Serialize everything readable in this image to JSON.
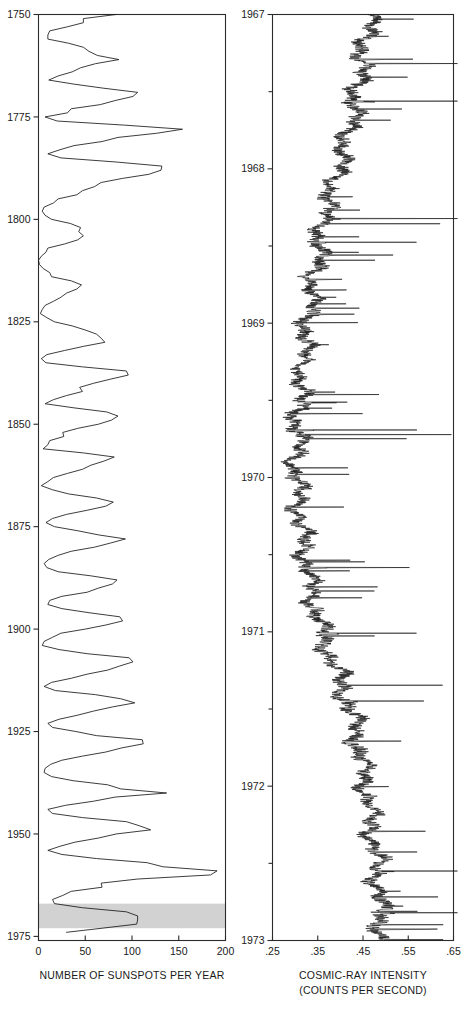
{
  "figure": {
    "background_color": "#ffffff",
    "line_color": "#1a1a1a",
    "shade_color": "#d2d2d2"
  },
  "chart_data": [
    {
      "id": "sunspots",
      "type": "line",
      "orientation": "vertical-time",
      "title": "",
      "xlabel": "NUMBER OF SUNSPOTS PER YEAR",
      "ylabel": "",
      "xlim": [
        0,
        200
      ],
      "ylim": [
        1750,
        1976
      ],
      "xticks": [
        0,
        50,
        100,
        150,
        200
      ],
      "xticklabels": [
        "0",
        "50",
        "100",
        "150",
        "200"
      ],
      "yticks": [
        1750,
        1775,
        1800,
        1825,
        1850,
        1875,
        1900,
        1925,
        1950,
        1975
      ],
      "yticklabels": [
        "1750",
        "1775",
        "1800",
        "1825",
        "1850",
        "1875",
        "1900",
        "1925",
        "1950",
        "1975"
      ],
      "grid": false,
      "legend": "none",
      "shaded_band": {
        "from": 1967,
        "to": 1973,
        "color": "#d2d2d2",
        "note": "interval covered by cosmic-ray record"
      },
      "x": [
        1750,
        1751,
        1752,
        1753,
        1754,
        1755,
        1756,
        1757,
        1758,
        1759,
        1760,
        1761,
        1762,
        1763,
        1764,
        1765,
        1766,
        1767,
        1768,
        1769,
        1770,
        1771,
        1772,
        1773,
        1774,
        1775,
        1776,
        1777,
        1778,
        1779,
        1780,
        1781,
        1782,
        1783,
        1784,
        1785,
        1786,
        1787,
        1788,
        1789,
        1790,
        1791,
        1792,
        1793,
        1794,
        1795,
        1796,
        1797,
        1798,
        1799,
        1800,
        1801,
        1802,
        1803,
        1804,
        1805,
        1806,
        1807,
        1808,
        1809,
        1810,
        1811,
        1812,
        1813,
        1814,
        1815,
        1816,
        1817,
        1818,
        1819,
        1820,
        1821,
        1822,
        1823,
        1824,
        1825,
        1826,
        1827,
        1828,
        1829,
        1830,
        1831,
        1832,
        1833,
        1834,
        1835,
        1836,
        1837,
        1838,
        1839,
        1840,
        1841,
        1842,
        1843,
        1844,
        1845,
        1846,
        1847,
        1848,
        1849,
        1850,
        1851,
        1852,
        1853,
        1854,
        1855,
        1856,
        1857,
        1858,
        1859,
        1860,
        1861,
        1862,
        1863,
        1864,
        1865,
        1866,
        1867,
        1868,
        1869,
        1870,
        1871,
        1872,
        1873,
        1874,
        1875,
        1876,
        1877,
        1878,
        1879,
        1880,
        1881,
        1882,
        1883,
        1884,
        1885,
        1886,
        1887,
        1888,
        1889,
        1890,
        1891,
        1892,
        1893,
        1894,
        1895,
        1896,
        1897,
        1898,
        1899,
        1900,
        1901,
        1902,
        1903,
        1904,
        1905,
        1906,
        1907,
        1908,
        1909,
        1910,
        1911,
        1912,
        1913,
        1914,
        1915,
        1916,
        1917,
        1918,
        1919,
        1920,
        1921,
        1922,
        1923,
        1924,
        1925,
        1926,
        1927,
        1928,
        1929,
        1930,
        1931,
        1932,
        1933,
        1934,
        1935,
        1936,
        1937,
        1938,
        1939,
        1940,
        1941,
        1942,
        1943,
        1944,
        1945,
        1946,
        1947,
        1948,
        1949,
        1950,
        1951,
        1952,
        1953,
        1954,
        1955,
        1956,
        1957,
        1958,
        1959,
        1960,
        1961,
        1962,
        1963,
        1964,
        1965,
        1966,
        1967,
        1968,
        1969,
        1970,
        1971,
        1972,
        1973,
        1974,
        1975
      ],
      "values": [
        83,
        48,
        48,
        31,
        12,
        10,
        10,
        32,
        48,
        54,
        63,
        86,
        61,
        45,
        36,
        21,
        11,
        38,
        70,
        106,
        101,
        82,
        66,
        35,
        31,
        7,
        20,
        92,
        154,
        126,
        85,
        68,
        38,
        23,
        10,
        24,
        83,
        132,
        131,
        118,
        90,
        67,
        60,
        47,
        41,
        21,
        16,
        6,
        4,
        7,
        14,
        34,
        45,
        43,
        48,
        42,
        28,
        10,
        8,
        3,
        0,
        1,
        5,
        12,
        14,
        35,
        46,
        41,
        30,
        24,
        16,
        7,
        4,
        2,
        9,
        17,
        36,
        50,
        62,
        67,
        71,
        48,
        28,
        9,
        3,
        8,
        47,
        94,
        96,
        77,
        59,
        44,
        47,
        30,
        16,
        7,
        38,
        73,
        85,
        78,
        64,
        42,
        26,
        27,
        12,
        10,
        5,
        48,
        81,
        70,
        56,
        47,
        31,
        16,
        10,
        3,
        15,
        32,
        62,
        80,
        72,
        52,
        30,
        15,
        8,
        17,
        42,
        64,
        93,
        77,
        60,
        35,
        21,
        11,
        6,
        9,
        21,
        56,
        84,
        79,
        64,
        52,
        25,
        12,
        10,
        25,
        54,
        87,
        90,
        72,
        50,
        24,
        15,
        6,
        4,
        22,
        52,
        97,
        101,
        87,
        74,
        52,
        35,
        14,
        6,
        18,
        61,
        88,
        103,
        79,
        59,
        42,
        22,
        10,
        15,
        40,
        62,
        111,
        112,
        89,
        72,
        47,
        25,
        13,
        7,
        6,
        14,
        37,
        74,
        88,
        137,
        82,
        59,
        29,
        10,
        15,
        47,
        94,
        108,
        120,
        83,
        64,
        39,
        23,
        10,
        25,
        62,
        116,
        133,
        191,
        184,
        106,
        67,
        68,
        35,
        26,
        15,
        17,
        47,
        94,
        106,
        106,
        105,
        68,
        30
      ]
    },
    {
      "id": "cosmic-ray",
      "type": "line",
      "orientation": "vertical-time",
      "title": "",
      "xlabel": "COSMIC-RAY INTENSITY",
      "xlabel_sub": "(COUNTS PER SECOND)",
      "ylabel": "",
      "xlim": [
        0.25,
        0.65
      ],
      "ylim": [
        1967.0,
        1973.0
      ],
      "xticks": [
        0.25,
        0.35,
        0.45,
        0.55,
        0.65
      ],
      "xticklabels": [
        ".25",
        ".35",
        ".45",
        ".55",
        ".65"
      ],
      "yticks": [
        1967,
        1968,
        1969,
        1970,
        1971,
        1972,
        1973
      ],
      "yticklabels": [
        "1967",
        "1968",
        "1969",
        "1970",
        "1971",
        "1972",
        "1973"
      ],
      "minor_yticks": [
        1967.5,
        1968.5,
        1969.5,
        1970.5,
        1971.5,
        1972.5
      ],
      "grid": false,
      "legend": "none",
      "description": "High-frequency cosmic-ray counting rate record; noisy trace with frequent large positive spikes extending toward higher counts. Baseline minimum near .30 in 1969-1970 (solar maximum), recovering toward .50 by 1973.",
      "baseline_profile": {
        "years": [
          1967.0,
          1967.3,
          1967.6,
          1968.0,
          1968.3,
          1968.6,
          1969.0,
          1969.3,
          1969.6,
          1970.0,
          1970.3,
          1970.6,
          1971.0,
          1971.3,
          1971.6,
          1972.0,
          1972.3,
          1972.6,
          1973.0
        ],
        "values": [
          0.465,
          0.445,
          0.43,
          0.395,
          0.36,
          0.345,
          0.325,
          0.315,
          0.305,
          0.3,
          0.31,
          0.325,
          0.355,
          0.395,
          0.43,
          0.455,
          0.47,
          0.48,
          0.49
        ]
      }
    }
  ],
  "panels": {
    "left": {
      "name": "sunspot-panel",
      "caption": "NUMBER OF SUNSPOTS PER YEAR"
    },
    "right": {
      "name": "cosmic-ray-panel",
      "caption_line1": "COSMIC-RAY INTENSITY",
      "caption_line2": "(COUNTS PER SECOND)"
    }
  }
}
